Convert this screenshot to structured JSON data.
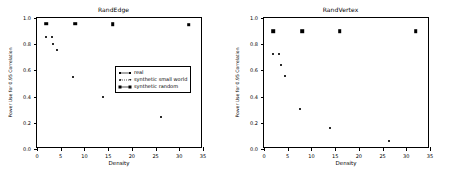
{
  "figure": {
    "background": "#ffffff",
    "marker_color": "#1a1a1a",
    "axis_color": "#000000"
  },
  "legend": {
    "position": "center-right",
    "entries": [
      {
        "label": "real",
        "marker": "small-dot-solid-line"
      },
      {
        "label": "synthetic small world",
        "marker": "small-dot-dotted-line"
      },
      {
        "label": "synthetic random",
        "marker": "large-dot-solid-line"
      }
    ]
  },
  "chart_data": [
    {
      "type": "scatter",
      "title": "RandEdge",
      "xlabel": "Density",
      "ylabel": "Power Use for 0.95 Correlation",
      "xlim": [
        0,
        35
      ],
      "ylim": [
        0.0,
        1.0
      ],
      "xticks": [
        0,
        5,
        10,
        15,
        20,
        25,
        30,
        35
      ],
      "yticks": [
        0.0,
        0.2,
        0.4,
        0.6,
        0.8,
        1.0
      ],
      "xticklabels": [
        "0",
        "5",
        "10",
        "15",
        "20",
        "25",
        "30",
        "35"
      ],
      "yticklabels": [
        "0.0",
        "0.2",
        "0.4",
        "0.6",
        "0.8",
        "1.0"
      ],
      "grid": false,
      "legend_position": "center-right",
      "series": [
        {
          "name": "synthetic random",
          "marker": "large-dot",
          "points": [
            {
              "x": 2.0,
              "y": 0.955
            },
            {
              "x": 8.0,
              "y": 0.955
            },
            {
              "x": 16.0,
              "y": 0.952
            },
            {
              "x": 32.0,
              "y": 0.95
            }
          ]
        },
        {
          "name": "real",
          "marker": "small-dot",
          "points": [
            {
              "x": 2.0,
              "y": 0.855
            },
            {
              "x": 3.2,
              "y": 0.855
            },
            {
              "x": 3.4,
              "y": 0.805
            },
            {
              "x": 4.3,
              "y": 0.752
            },
            {
              "x": 7.6,
              "y": 0.552
            },
            {
              "x": 14.0,
              "y": 0.4
            },
            {
              "x": 26.2,
              "y": 0.243
            }
          ]
        },
        {
          "name": "synthetic small world",
          "marker": "small-dot",
          "points": []
        }
      ]
    },
    {
      "type": "scatter",
      "title": "RandVertex",
      "xlabel": "Density",
      "ylabel": "Power Use for 0.95 Correlation",
      "xlim": [
        0,
        35
      ],
      "ylim": [
        0.0,
        1.0
      ],
      "xticks": [
        0,
        5,
        10,
        15,
        20,
        25,
        30,
        35
      ],
      "yticks": [
        0.0,
        0.2,
        0.4,
        0.6,
        0.8,
        1.0
      ],
      "xticklabels": [
        "0",
        "5",
        "10",
        "15",
        "20",
        "25",
        "30",
        "35"
      ],
      "yticklabels": [
        "0.0",
        "0.2",
        "0.4",
        "0.6",
        "0.8",
        "1.0"
      ],
      "grid": false,
      "legend_position": "none",
      "series": [
        {
          "name": "synthetic random",
          "marker": "large-dot",
          "points": [
            {
              "x": 2.0,
              "y": 0.9
            },
            {
              "x": 8.0,
              "y": 0.9
            },
            {
              "x": 16.0,
              "y": 0.898
            },
            {
              "x": 32.0,
              "y": 0.9
            }
          ]
        },
        {
          "name": "real",
          "marker": "small-dot",
          "points": [
            {
              "x": 2.0,
              "y": 0.722
            },
            {
              "x": 3.2,
              "y": 0.722
            },
            {
              "x": 3.5,
              "y": 0.638
            },
            {
              "x": 4.4,
              "y": 0.558
            },
            {
              "x": 7.6,
              "y": 0.308
            },
            {
              "x": 14.0,
              "y": 0.16
            },
            {
              "x": 26.3,
              "y": 0.058
            }
          ]
        },
        {
          "name": "synthetic small world",
          "marker": "small-dot",
          "points": []
        }
      ]
    }
  ]
}
